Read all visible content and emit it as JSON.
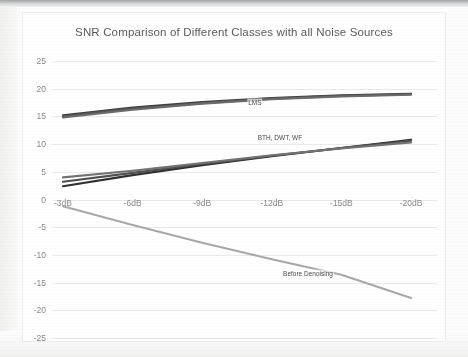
{
  "chart_data": {
    "type": "line",
    "title": "SNR Comparison of Different Classes with all Noise Sources",
    "xlabel": "",
    "ylabel": "",
    "categories": [
      "-3dB",
      "-6dB",
      "-9dB",
      "-12dB",
      "-15dB",
      "-20dB"
    ],
    "ylim": [
      -25,
      25
    ],
    "yticks": [
      25,
      20,
      15,
      10,
      5,
      0,
      -5,
      -10,
      -15,
      -20,
      -25
    ],
    "grid": true,
    "legend_position": "inline-annotations",
    "series": [
      {
        "name": "LMS",
        "color": "#3d3d3d",
        "values": [
          15.2,
          16.6,
          17.6,
          18.3,
          18.8,
          19.1
        ]
      },
      {
        "name": "LMS",
        "color": "#565656",
        "values": [
          15.0,
          16.4,
          17.4,
          18.2,
          18.7,
          19.0
        ]
      },
      {
        "name": "LMS",
        "color": "#6b6b6b",
        "values": [
          14.8,
          16.2,
          17.3,
          18.1,
          18.6,
          18.9
        ]
      },
      {
        "name": "BTH",
        "color": "#2f2f2f",
        "values": [
          2.4,
          4.4,
          6.2,
          7.8,
          9.3,
          10.8
        ]
      },
      {
        "name": "DWT",
        "color": "#4f4f4f",
        "values": [
          3.2,
          4.8,
          6.4,
          7.9,
          9.3,
          10.6
        ]
      },
      {
        "name": "WF",
        "color": "#737373",
        "values": [
          4.0,
          5.2,
          6.6,
          8.0,
          9.2,
          10.3
        ]
      },
      {
        "name": "Before Denoising",
        "color": "#a8a8a8",
        "values": [
          -1.2,
          -4.6,
          -7.8,
          -10.8,
          -13.6,
          -17.8
        ]
      }
    ],
    "annotations": [
      {
        "text": "LMS",
        "x_frac": 0.527,
        "value": 17.6
      },
      {
        "text": "BTH, DWT, WF",
        "x_frac": 0.592,
        "value": 11.3
      },
      {
        "text": "Before Denoising",
        "x_frac": 0.665,
        "value": -13.3
      }
    ]
  }
}
